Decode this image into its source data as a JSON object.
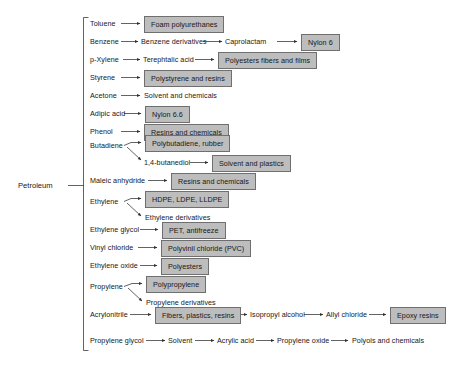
{
  "diagram": {
    "root": {
      "label": "Petroleum"
    },
    "colors": {
      "box_fill": "#bdbdbd",
      "box_border": "#6f6f6f",
      "text": "#171717",
      "line": "#3a3a3a",
      "background": "#ffffff"
    },
    "branches": [
      {
        "id": "toluene",
        "feedstock": "Toluene",
        "chain": [
          {
            "label": "Foam polyurethanes",
            "boxed": true
          }
        ]
      },
      {
        "id": "benzene",
        "feedstock": "Benzene",
        "chain": [
          {
            "label": "Benzene derivatives",
            "boxed": false
          },
          {
            "label": "Caprolactam",
            "boxed": false
          },
          {
            "label": "Nylon 6",
            "boxed": true
          }
        ]
      },
      {
        "id": "p-xylene",
        "feedstock": "p-Xylene",
        "chain": [
          {
            "label": "Terephtalic acid",
            "boxed": false
          },
          {
            "label": "Polyesters fibers and films",
            "boxed": true
          }
        ]
      },
      {
        "id": "styrene",
        "feedstock": "Styrene",
        "chain": [
          {
            "label": "Polystyrene and resins",
            "boxed": true
          }
        ]
      },
      {
        "id": "acetone",
        "feedstock": "Acetone",
        "chain": [
          {
            "label": "Solvent and chemicals",
            "boxed": false
          }
        ]
      },
      {
        "id": "adipic-acid",
        "feedstock": "Adipic acid",
        "chain": [
          {
            "label": "Nylon 6.6",
            "boxed": true
          }
        ]
      },
      {
        "id": "phenol",
        "feedstock": "Phenol",
        "chain": [
          {
            "label": "Resins and chemicals",
            "boxed": true
          }
        ]
      },
      {
        "id": "butadiene",
        "feedstock": "Butadiene",
        "split": true,
        "chain": [
          {
            "label": "Polybutadiene, rubber",
            "boxed": true
          }
        ],
        "second_chain": [
          {
            "label": "1,4-butanediol",
            "boxed": false
          },
          {
            "label": "Solvent and plastics",
            "boxed": true
          }
        ]
      },
      {
        "id": "maleic-anhydride",
        "feedstock": "Maleic anhydride",
        "chain": [
          {
            "label": "Resins and chemicals",
            "boxed": true
          }
        ]
      },
      {
        "id": "ethylene",
        "feedstock": "Ethylene",
        "split": true,
        "chain": [
          {
            "label": "HDPE, LDPE, LLDPE",
            "boxed": true
          }
        ],
        "second_chain": [
          {
            "label": "Ethylene derivatives",
            "boxed": false
          }
        ]
      },
      {
        "id": "ethylene-glycol",
        "feedstock": "Ethylene glycol",
        "chain": [
          {
            "label": "PET, antifreeze",
            "boxed": true
          }
        ]
      },
      {
        "id": "vinyl-chloride",
        "feedstock": "Vinyl chloride",
        "chain": [
          {
            "label": "Polyvinil chloride (PVC)",
            "boxed": true
          }
        ]
      },
      {
        "id": "ethylene-oxide",
        "feedstock": "Ethylene oxide",
        "chain": [
          {
            "label": "Polyesters",
            "boxed": true
          }
        ]
      },
      {
        "id": "propylene",
        "feedstock": "Propylene",
        "split": true,
        "chain": [
          {
            "label": "Polypropylene",
            "boxed": true
          }
        ],
        "second_chain": [
          {
            "label": "Propylene derivatives",
            "boxed": false
          }
        ]
      },
      {
        "id": "acrylonitrile",
        "feedstock": "Acrylonitrile",
        "chain": [
          {
            "label": "Fibers, plastics, resins",
            "boxed": true
          },
          {
            "label": "Isopropyl alcohol",
            "boxed": false
          },
          {
            "label": "Allyl chloride",
            "boxed": false
          },
          {
            "label": "Epoxy resins",
            "boxed": true
          }
        ]
      },
      {
        "id": "propylene-glycol",
        "feedstock": "Propylene glycol",
        "chain": [
          {
            "label": "Solvent",
            "boxed": false
          },
          {
            "label": "Acrylic acid",
            "boxed": false
          },
          {
            "label": "Propylene oxide",
            "boxed": false
          },
          {
            "label": "Polyols and chemicals",
            "boxed": false
          }
        ]
      }
    ]
  }
}
